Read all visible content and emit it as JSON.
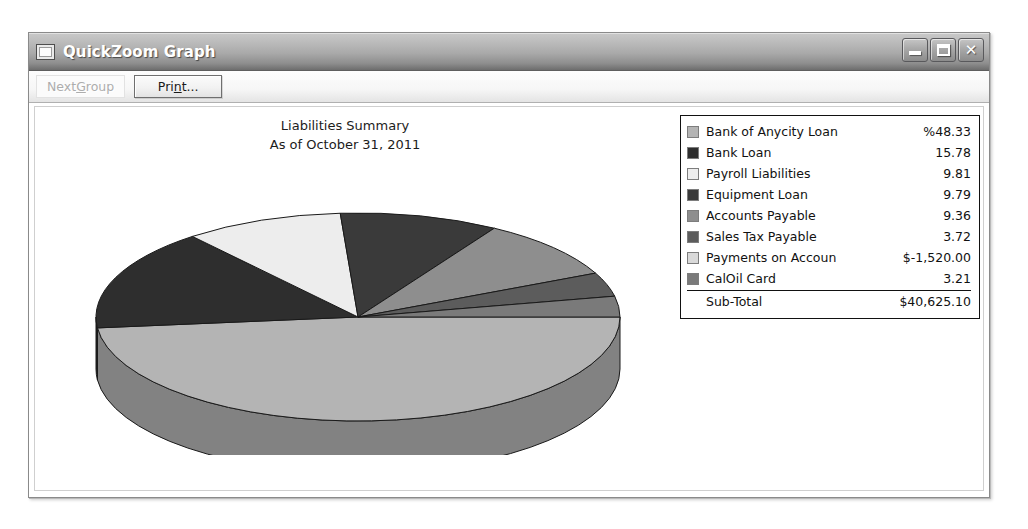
{
  "window": {
    "title": "QuickZoom Graph",
    "icon": "window-app-icon",
    "buttons": {
      "minimize": "minimize-icon",
      "maximize": "maximize-icon",
      "close": "✕"
    }
  },
  "toolbar": {
    "next_group": {
      "label_pre": "Next ",
      "accel": "G",
      "label_post": "roup",
      "enabled": false
    },
    "print": {
      "label_pre": "Pri",
      "accel": "n",
      "label_post": "t...",
      "enabled": true
    }
  },
  "chart_data": {
    "type": "pie",
    "title": "Liabilities Summary",
    "subtitle": "As of October 31, 2011",
    "value_unit": "percent",
    "percent_symbol_prefix": "%",
    "categories": [
      "Bank of Anycity Loan",
      "Bank Loan",
      "Payroll Liabilities",
      "Equipment Loan",
      "Accounts Payable",
      "Sales Tax Payable",
      "Payments on Accoun",
      "CalOil Card"
    ],
    "values": [
      48.33,
      15.78,
      9.81,
      9.79,
      9.36,
      3.72,
      -1520.0,
      3.21
    ],
    "display_values": [
      "%48.33",
      "15.78",
      "9.81",
      "9.79",
      "9.36",
      "3.72",
      "$-1,520.00",
      "3.21"
    ],
    "slice_percent": [
      48.33,
      15.78,
      9.81,
      9.79,
      9.36,
      3.72,
      0.0,
      3.21
    ],
    "colors": [
      "#b4b4b4",
      "#2e2e2e",
      "#ededed",
      "#3a3a3a",
      "#8e8e8e",
      "#5c5c5c",
      "#d9d9d9",
      "#7a7a7a"
    ],
    "total_label": "Sub-Total",
    "total_value": "$40,625.10",
    "legend_position": "right",
    "grid": false
  }
}
